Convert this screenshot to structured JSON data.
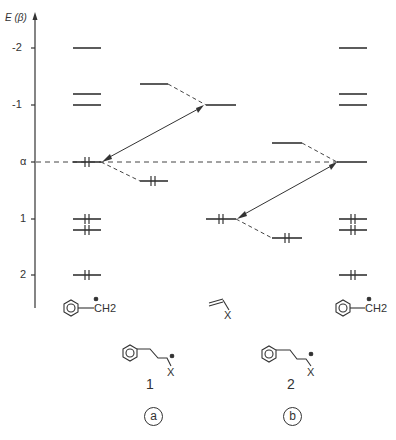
{
  "axis": {
    "title": "E (β)",
    "ticks": [
      {
        "label": "-2",
        "value": -2
      },
      {
        "label": "-1",
        "value": -1
      },
      {
        "label": "α",
        "value": 0
      },
      {
        "label": "1",
        "value": 1
      },
      {
        "label": "2",
        "value": 2
      }
    ]
  },
  "columns": {
    "left_benzyl": {
      "label": "benzyl cation",
      "formula": "CH2",
      "charge": "⊕",
      "levels": [
        -2,
        -1.2,
        -1,
        0,
        1,
        1.2,
        2
      ],
      "occupied": [
        0,
        1,
        1.2,
        2
      ]
    },
    "alkene_x": {
      "label": "X-substituted alkene",
      "substituent": "X"
    },
    "right_benzyl": {
      "label": "benzyl cation",
      "formula": "CH2",
      "charge": "⊕",
      "levels": [
        -2,
        -1.2,
        -1,
        0,
        1,
        1.2,
        2
      ],
      "occupied": [
        1,
        1.2,
        2
      ]
    }
  },
  "panels": [
    {
      "id": "a",
      "label": "a",
      "compound_number": "1",
      "substituent": "X",
      "charge": "⊕"
    },
    {
      "id": "b",
      "label": "b",
      "compound_number": "2",
      "substituent": "X",
      "charge": "⊕"
    }
  ]
}
